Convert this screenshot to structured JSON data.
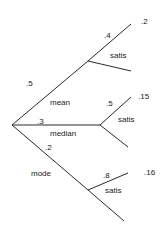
{
  "tree": {
    "root": {
      "branches": [
        {
          "name": "mean",
          "probability": ".5",
          "child": {
            "branches": [
              {
                "name": "satis",
                "probability": ".4",
                "joint": ".2"
              },
              {
                "name": "",
                "probability": "",
                "joint": ""
              }
            ]
          }
        },
        {
          "name": "median",
          "probability": ".3",
          "child": {
            "branches": [
              {
                "name": "satis",
                "probability": ".5",
                "joint": ".15"
              },
              {
                "name": "",
                "probability": "",
                "joint": ""
              }
            ]
          }
        },
        {
          "name": "mode",
          "probability": ".2",
          "child": {
            "branches": [
              {
                "name": "satis",
                "probability": ".8",
                "joint": ".16"
              },
              {
                "name": "",
                "probability": "",
                "joint": ""
              }
            ]
          }
        }
      ]
    }
  }
}
